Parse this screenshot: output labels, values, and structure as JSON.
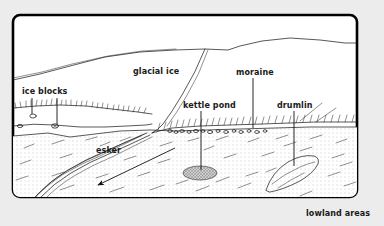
{
  "figure": {
    "background_color": "#ececec",
    "frame_color": "#000000",
    "panel_color": "#ffffff",
    "ink_color": "#111111"
  },
  "top_artifact": {
    "text": ""
  },
  "labels": {
    "ice_blocks": "ice blocks",
    "glacial_ice": "glacial ice",
    "moraine": "moraine",
    "kettle_pond": "kettle pond",
    "drumlin": "drumlin",
    "esker": "esker",
    "lowland_areas": "lowland areas"
  },
  "features": [
    {
      "id": "glacial-ice",
      "label": "glacial ice",
      "kind": "ice-mass",
      "description": "Large ice sheet occupying upper portion of the section",
      "label_x": 133,
      "label_y": 72,
      "has_leader": false
    },
    {
      "id": "ice-blocks",
      "label": "ice blocks",
      "kind": "buried-ice",
      "description": "Two small buried ice blocks in the outwash near left edge",
      "label_x": 22,
      "label_y": 94,
      "has_leader": true
    },
    {
      "id": "moraine",
      "label": "moraine",
      "kind": "ridge",
      "description": "Bouldery ridge of debris along the ice margin",
      "label_x": 237,
      "label_y": 74,
      "has_leader": true
    },
    {
      "id": "kettle-pond",
      "label": "kettle pond",
      "kind": "depression-water",
      "description": "Water filled depression left by melted ice block",
      "label_x": 185,
      "label_y": 107,
      "has_leader": true
    },
    {
      "id": "drumlin",
      "label": "drumlin",
      "kind": "streamlined-hill",
      "description": "Elongate streamlined hill of glacial till",
      "label_x": 276,
      "label_y": 107,
      "has_leader": true
    },
    {
      "id": "esker",
      "label": "esker",
      "kind": "sinuous-ridge",
      "description": "Sinuous ridge of meltwater stream deposits",
      "label_x": 97,
      "label_y": 152,
      "has_leader": false
    },
    {
      "id": "lowland-areas",
      "label": "lowland areas",
      "kind": "caption",
      "description": "Caption outside the frame at lower right naming the stippled plain",
      "label_x": 310,
      "label_y": 216,
      "has_leader": false
    }
  ],
  "flow": {
    "arrow_label": "",
    "direction": "ice/meltwater flow toward lower left",
    "from_x": 175,
    "from_y": 148,
    "to_x": 96,
    "to_y": 186
  }
}
